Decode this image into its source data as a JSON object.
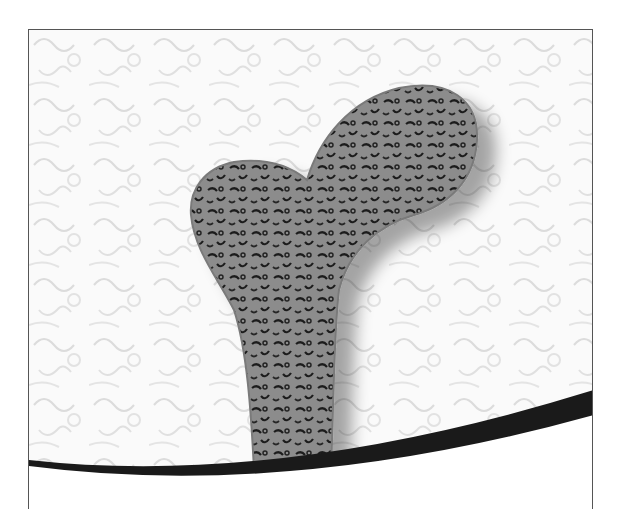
{
  "image": {
    "subject": "femur-bone-filigree-illustration",
    "description": "A stylized grey femur bone with ornate lacy swirl cut-out pattern, set against a white embossed swirl-textured background, framed with a thin dark border and a black swoosh curve along the bottom.",
    "colors": {
      "background": "#ffffff",
      "texture": "#f2f2f2",
      "bone": "#8a8a8a",
      "bone_holes": "#2a2a2a",
      "swoosh": "#1a1a1a",
      "frame": "#555555"
    }
  }
}
